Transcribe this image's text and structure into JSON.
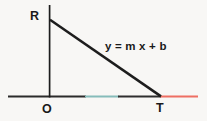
{
  "figure": {
    "background_color": "#f8f7f5",
    "width": 207,
    "height": 121,
    "labels": {
      "vertex_top": "R",
      "vertex_origin": "O",
      "vertex_right": "T",
      "equation": "y = m x + b"
    },
    "colors": {
      "stroke_dark": "#1d1d1d",
      "axis_dark": "#2b2b2b",
      "axis_teal_tint": "#7fb8b8",
      "axis_red": "#ee6f63",
      "text": "#1a1a1a"
    },
    "geometry": {
      "vertical_leg": {
        "x": 49.5,
        "y_top": 5,
        "y_bottom": 97
      },
      "horizontal_axis": {
        "y": 96.5,
        "x_start": 8,
        "x_end": 198
      },
      "hypotenuse": {
        "x1": 50,
        "y1": 20,
        "x2": 161,
        "y2": 96
      },
      "axis_red_segment": {
        "x_start": 160,
        "x_end": 198
      },
      "axis_teal_segment": {
        "x_start": 85,
        "x_end": 119
      }
    }
  }
}
